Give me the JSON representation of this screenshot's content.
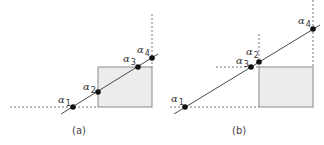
{
  "colors": {
    "rect_fill": "#ececec",
    "rect_stroke": "#8a8a8a",
    "line": "#4a4a4a",
    "dash": "#777777",
    "point": "#111111"
  },
  "panels": [
    {
      "caption": "(a)",
      "points": [
        {
          "symbol": "α",
          "index": "1"
        },
        {
          "symbol": "α",
          "index": "2"
        },
        {
          "symbol": "α",
          "index": "3"
        },
        {
          "symbol": "α",
          "index": "4"
        }
      ]
    },
    {
      "caption": "(b)",
      "points": [
        {
          "symbol": "α",
          "index": "1"
        },
        {
          "symbol": "α",
          "index": "2"
        },
        {
          "symbol": "α",
          "index": "3"
        },
        {
          "symbol": "α",
          "index": "4"
        }
      ]
    }
  ]
}
